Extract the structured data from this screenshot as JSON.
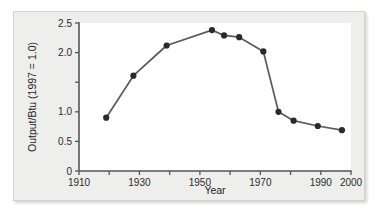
{
  "figure": {
    "background_color": "#eeeeec",
    "plot_background_color": "#ffffff",
    "line_color": "#5a5a60",
    "marker_color": "#2a2a2e",
    "axis_color": "#56565a"
  },
  "chart_data": {
    "type": "line",
    "title": "",
    "xlabel": "Year",
    "ylabel": "Output/Btu (1997 = 1.0)",
    "xlim": [
      1910,
      2000
    ],
    "ylim": [
      0,
      2.5
    ],
    "grid": false,
    "legend": null,
    "x_ticks": [
      1910,
      1920,
      1930,
      1940,
      1950,
      1960,
      1970,
      1980,
      1990,
      2000
    ],
    "x_tick_labels": [
      "1910",
      "",
      "1930",
      "",
      "1950",
      "",
      "1970",
      "",
      "1990",
      "2000"
    ],
    "y_ticks": [
      0,
      0.5,
      1.0,
      1.5,
      2.0,
      2.5
    ],
    "y_tick_labels": [
      "0",
      "0.5",
      "1.0",
      "",
      "2.0",
      "2.5"
    ],
    "series": [
      {
        "name": "Output per Btu",
        "x": [
          1919,
          1928,
          1939,
          1954,
          1958,
          1963,
          1971,
          1976,
          1981,
          1989,
          1997
        ],
        "values": [
          0.9,
          1.61,
          2.12,
          2.38,
          2.29,
          2.26,
          2.02,
          1.0,
          0.85,
          0.76,
          0.69
        ]
      }
    ]
  }
}
